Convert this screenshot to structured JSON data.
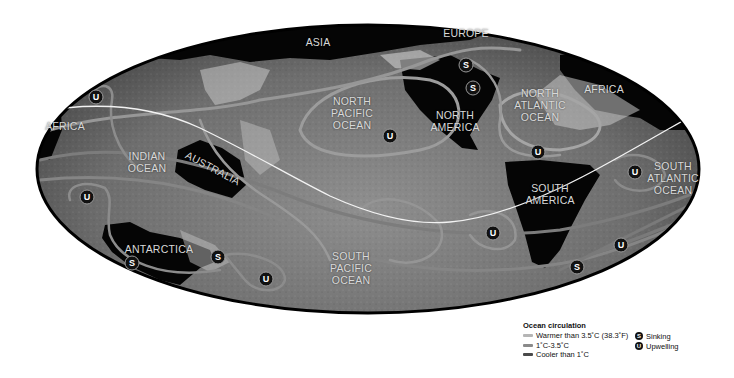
{
  "map": {
    "projection": "oval world map (Pacific-centered)",
    "regions": [
      {
        "id": "asia",
        "label": "ASIA",
        "x": 318,
        "y": 42
      },
      {
        "id": "europe",
        "label": "EUROPE",
        "x": 466,
        "y": 33
      },
      {
        "id": "africa-east",
        "label": "AFRICA",
        "x": 604,
        "y": 89
      },
      {
        "id": "africa-west",
        "label": "AFRICA",
        "x": 65,
        "y": 126
      },
      {
        "id": "north-pacific",
        "label": "NORTH\nPACIFIC\nOCEAN",
        "x": 352,
        "y": 113
      },
      {
        "id": "north-america",
        "label": "NORTH\nAMERICA",
        "x": 455,
        "y": 121
      },
      {
        "id": "north-atlantic",
        "label": "NORTH\nATLANTIC\nOCEAN",
        "x": 540,
        "y": 105
      },
      {
        "id": "indian-ocean",
        "label": "INDIAN\nOCEAN",
        "x": 147,
        "y": 162
      },
      {
        "id": "australia",
        "label": "AUSTRALIA",
        "x": 213,
        "y": 168
      },
      {
        "id": "south-america",
        "label": "SOUTH\nAMERICA",
        "x": 550,
        "y": 194
      },
      {
        "id": "south-atlantic",
        "label": "SOUTH\nATLANTIC\nOCEAN",
        "x": 673,
        "y": 178
      },
      {
        "id": "antarctica",
        "label": "ANTARCTICA",
        "x": 159,
        "y": 249
      },
      {
        "id": "south-pacific",
        "label": "SOUTH\nPACIFIC\nOCEAN",
        "x": 351,
        "y": 268
      }
    ],
    "markers": [
      {
        "type": "U",
        "x": 96,
        "y": 97
      },
      {
        "type": "U",
        "x": 87,
        "y": 197
      },
      {
        "type": "S",
        "x": 132,
        "y": 263
      },
      {
        "type": "S",
        "x": 218,
        "y": 257
      },
      {
        "type": "U",
        "x": 266,
        "y": 279
      },
      {
        "type": "U",
        "x": 390,
        "y": 136
      },
      {
        "type": "S",
        "x": 466,
        "y": 65
      },
      {
        "type": "S",
        "x": 473,
        "y": 88
      },
      {
        "type": "U",
        "x": 538,
        "y": 152
      },
      {
        "type": "U",
        "x": 493,
        "y": 233
      },
      {
        "type": "U",
        "x": 635,
        "y": 172
      },
      {
        "type": "U",
        "x": 621,
        "y": 245
      },
      {
        "type": "S",
        "x": 577,
        "y": 267
      }
    ]
  },
  "legend": {
    "title": "Ocean circulation",
    "items": [
      {
        "label": "Warmer than 3.5˚C (38.3˚F)",
        "color": "#b5b5b5"
      },
      {
        "label": "1˚C-3.5˚C",
        "color": "#8a8a8a"
      },
      {
        "label": "Cooler than 1˚C",
        "color": "#4a4a4a"
      }
    ],
    "markers": [
      {
        "symbol": "S",
        "label": "Sinking"
      },
      {
        "symbol": "U",
        "label": "Upwelling"
      }
    ]
  }
}
